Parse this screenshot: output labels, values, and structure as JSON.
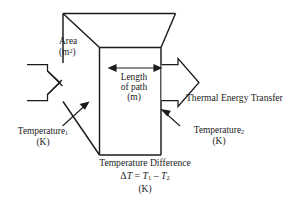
{
  "figure": {
    "kind": "thermal-conduction-block-diagram",
    "background_color": "#ffffff",
    "line_color": "#1b1b1b",
    "text_color": "#1b1b1b"
  },
  "labels": {
    "area": {
      "name": "Area",
      "unit": "(m",
      "unit_exponent": "2",
      "unit_close": ")"
    },
    "length": {
      "line1": "Length",
      "line2": "of path",
      "line3": "(m)"
    },
    "thermal_energy_transfer": "Thermal Energy Transfer",
    "temperature_1": {
      "name": "Temperature",
      "subscript": "1",
      "unit": "(K)"
    },
    "temperature_2": {
      "name": "Temperature",
      "subscript": "2",
      "unit": "(K)"
    },
    "temperature_difference": {
      "title": "Temperature Difference",
      "equation_delta": "Δ",
      "equation_T": "T",
      "equation_eq": " = ",
      "equation_T1": "T",
      "equation_sub1": "1",
      "equation_minus": " – ",
      "equation_T2": "T",
      "equation_sub2": "2",
      "unit": "(K)"
    }
  }
}
